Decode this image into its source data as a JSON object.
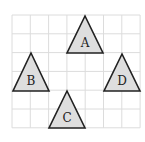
{
  "diagram": {
    "grid": {
      "x0": 12,
      "y0": 15,
      "cols": 7,
      "rows": 6,
      "cell_w": 18.3,
      "cell_h": 18.8,
      "line_color": "#dcdcdc"
    },
    "fill_color": "#dedede",
    "stroke_color": "#222222",
    "shapes": [
      {
        "label": "A",
        "points": "85,16 67,53 103,53",
        "label_x": 85,
        "label_y": 47
      },
      {
        "label": "B",
        "points": "31,53 13,91 49,91",
        "label_x": 31,
        "label_y": 85
      },
      {
        "label": "C",
        "points": "67,91 49,128 85,128",
        "label_x": 67,
        "label_y": 122
      },
      {
        "label": "D",
        "points": "122,54 104,91 140,91",
        "label_x": 122,
        "label_y": 85
      }
    ]
  }
}
